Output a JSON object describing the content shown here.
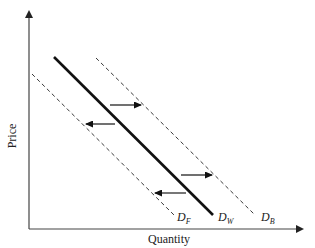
{
  "diagram": {
    "type": "supply-demand shift diagram",
    "axes": {
      "x_label": "Quantity",
      "y_label": "Price"
    },
    "curves": [
      {
        "id": "DF",
        "label_main": "D",
        "label_sub": "F",
        "style": "dashed",
        "description": "shifted demand (left)"
      },
      {
        "id": "DW",
        "label_main": "D",
        "label_sub": "W",
        "style": "solid",
        "description": "original demand"
      },
      {
        "id": "DB",
        "label_main": "D",
        "label_sub": "B",
        "style": "dashed",
        "description": "shifted demand (right)"
      }
    ],
    "arrows": [
      {
        "direction": "right",
        "position": "upper",
        "from_curve": "DW",
        "to_curve": "DB"
      },
      {
        "direction": "left",
        "position": "upper",
        "from_curve": "DW",
        "to_curve": "DF"
      },
      {
        "direction": "right",
        "position": "lower",
        "from_curve": "DW",
        "to_curve": "DB"
      },
      {
        "direction": "left",
        "position": "lower",
        "from_curve": "DW",
        "to_curve": "DF"
      }
    ],
    "colors": {
      "line": "#111111",
      "axis": "#333333"
    }
  }
}
